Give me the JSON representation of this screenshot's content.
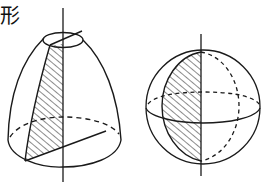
{
  "caption": {
    "text": "形"
  },
  "figures": [
    {
      "id": "left",
      "shape": "paraboloid-of-revolution",
      "description": "Bell-shaped solid of revolution with vertical axis, top ellipse opening, hatched planar cross-section region and radius line at base"
    },
    {
      "id": "right",
      "shape": "sphere",
      "description": "Sphere with vertical axis, equator ellipse (front solid, back dashed), and hatched semicircular cross-section on the left half"
    }
  ],
  "colors": {
    "stroke": "#1a1a1a",
    "background": "#ffffff"
  }
}
